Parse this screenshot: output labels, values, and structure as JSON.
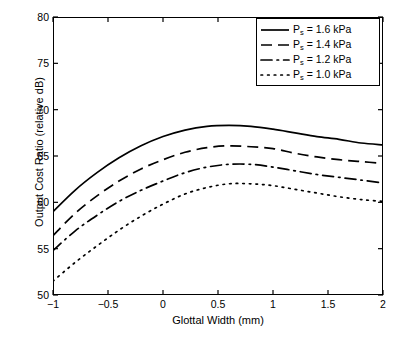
{
  "chart_data": {
    "type": "line",
    "title": "",
    "xlabel": "Glottal Width (mm)",
    "ylabel": "Output Cost Ratio (relative dB)",
    "xlim": [
      -1,
      2
    ],
    "ylim": [
      50,
      80
    ],
    "xticks": [
      "-1",
      "-0.5",
      "0",
      "0.5",
      "1",
      "1.5",
      "2"
    ],
    "xtick_values": [
      -1,
      -0.5,
      0,
      0.5,
      1,
      1.5,
      2
    ],
    "yticks": [
      "50",
      "55",
      "60",
      "65",
      "70",
      "75",
      "80"
    ],
    "ytick_values": [
      50,
      55,
      60,
      65,
      70,
      75,
      80
    ],
    "grid": false,
    "legend_position": "top-right",
    "line_color": "#000000",
    "x": [
      -1.0,
      -0.8,
      -0.6,
      -0.4,
      -0.2,
      0.0,
      0.2,
      0.4,
      0.6,
      0.8,
      1.0,
      1.2,
      1.4,
      1.6,
      1.8,
      2.0
    ],
    "series": [
      {
        "name": "P_s = 1.6 kPa",
        "label_main": "P",
        "label_sub": "s",
        "label_rest": " = 1.6 kPa",
        "style": "solid",
        "values": [
          59.0,
          61.3,
          63.2,
          64.8,
          66.1,
          67.1,
          67.8,
          68.2,
          68.3,
          68.2,
          67.9,
          67.5,
          67.1,
          66.8,
          66.4,
          66.2
        ]
      },
      {
        "name": "P_s = 1.4 kPa",
        "label_main": "P",
        "label_sub": "s",
        "label_rest": " = 1.4 kPa",
        "style": "dashed",
        "values": [
          56.4,
          58.8,
          60.7,
          62.3,
          63.6,
          64.6,
          65.4,
          65.9,
          66.1,
          66.0,
          65.8,
          65.3,
          64.9,
          64.6,
          64.4,
          64.2
        ]
      },
      {
        "name": "P_s = 1.2 kPa",
        "label_main": "P",
        "label_sub": "s",
        "label_rest": " = 1.2 kPa",
        "style": "dashdot",
        "values": [
          54.8,
          56.9,
          58.6,
          60.1,
          61.3,
          62.3,
          63.2,
          63.8,
          64.1,
          64.1,
          63.8,
          63.4,
          63.0,
          62.7,
          62.4,
          62.1
        ]
      },
      {
        "name": "P_s = 1.0 kPa",
        "label_main": "P",
        "label_sub": "s",
        "label_rest": " = 1.0 kPa",
        "style": "dotted",
        "values": [
          51.5,
          53.5,
          55.3,
          57.0,
          58.5,
          59.8,
          60.9,
          61.6,
          62.0,
          62.0,
          61.8,
          61.4,
          61.0,
          60.6,
          60.3,
          60.1
        ]
      }
    ]
  }
}
